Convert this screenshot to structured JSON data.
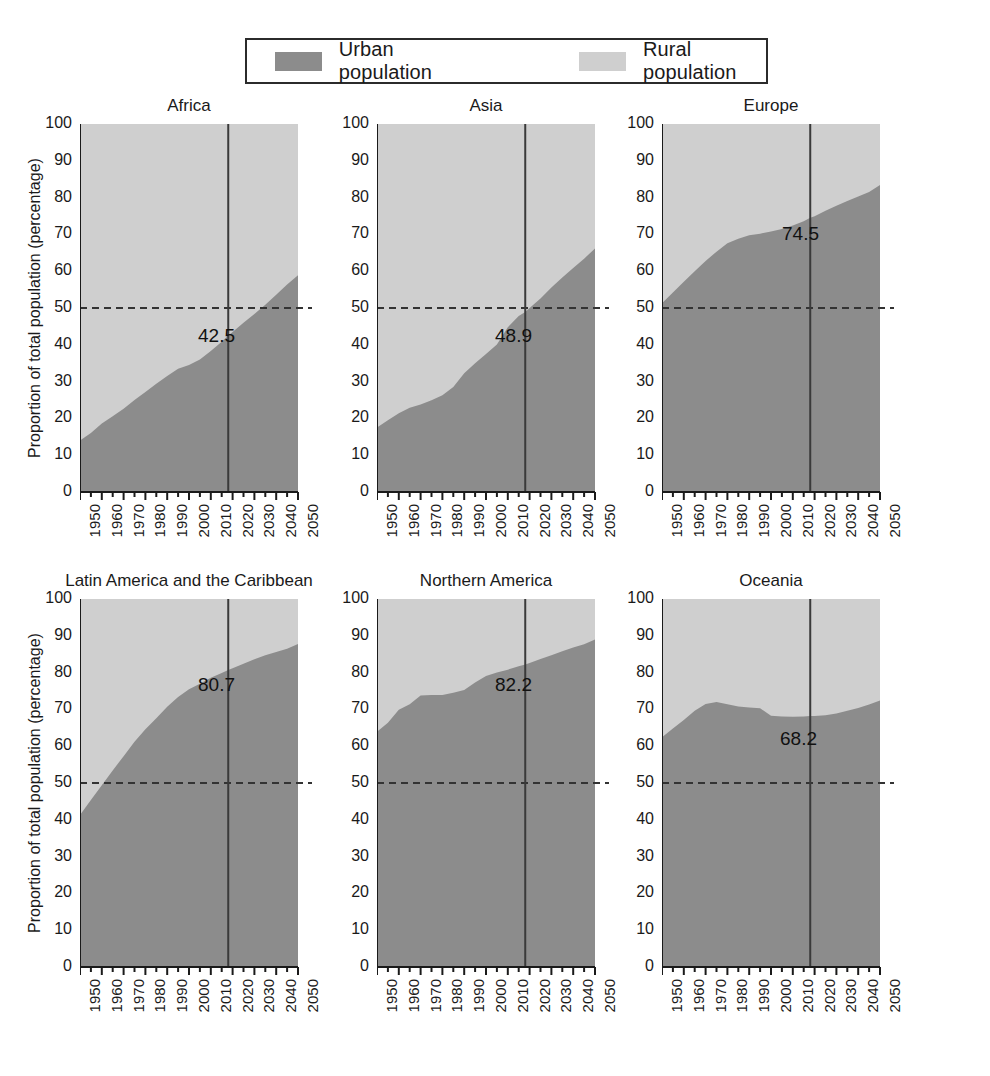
{
  "legend": {
    "urban_label": "Urban population",
    "rural_label": "Rural population",
    "urban_color": "#8c8c8c",
    "rural_color": "#cfcfcf"
  },
  "axis": {
    "ylabel": "Proportion of total population (percentage)",
    "yticks": [
      "100",
      "90",
      "80",
      "70",
      "60",
      "50",
      "40",
      "30",
      "20",
      "10",
      "0"
    ],
    "xticks": [
      "1950",
      "1960",
      "1970",
      "1980",
      "1990",
      "2000",
      "2010",
      "2020",
      "2030",
      "2040",
      "2050"
    ],
    "ylim": [
      0,
      100
    ],
    "xlim": [
      1950,
      2050
    ],
    "reference_line": 50,
    "marker_year": 2018
  },
  "chart_data": {
    "type": "area",
    "title": "",
    "xlabel": "",
    "ylabel": "Proportion of total population (percentage)",
    "ylim": [
      0,
      100
    ],
    "xlim": [
      1950,
      2050
    ],
    "grid": false,
    "legend_position": "top",
    "legend": [
      "Urban population",
      "Rural population"
    ],
    "reference_line_y": 50,
    "marker_year": 2018,
    "x": [
      1950,
      1955,
      1960,
      1965,
      1970,
      1975,
      1980,
      1985,
      1990,
      1995,
      2000,
      2005,
      2010,
      2015,
      2018,
      2020,
      2025,
      2030,
      2035,
      2040,
      2045,
      2050
    ],
    "panels": [
      {
        "name": "Africa",
        "value_label": "42.5",
        "urban": [
          14.0,
          16.0,
          18.6,
          20.6,
          22.6,
          25.0,
          27.2,
          29.4,
          31.5,
          33.5,
          34.5,
          36.0,
          38.3,
          40.8,
          42.5,
          43.5,
          46.0,
          48.4,
          50.9,
          53.6,
          56.4,
          58.9
        ],
        "rural": [
          86.0,
          84.0,
          81.4,
          79.4,
          77.4,
          75.0,
          72.8,
          70.6,
          68.5,
          66.5,
          65.5,
          64.0,
          61.7,
          59.2,
          57.5,
          56.5,
          54.0,
          51.6,
          49.1,
          46.4,
          43.6,
          41.1
        ]
      },
      {
        "name": "Asia",
        "value_label": "48.9",
        "urban": [
          17.5,
          19.5,
          21.4,
          22.9,
          23.8,
          24.9,
          26.3,
          28.5,
          32.3,
          35.0,
          37.5,
          40.1,
          44.8,
          47.8,
          48.9,
          50.0,
          52.6,
          55.6,
          58.3,
          60.9,
          63.4,
          66.2
        ],
        "rural": [
          82.5,
          80.5,
          78.6,
          77.1,
          76.2,
          75.1,
          73.7,
          71.5,
          67.7,
          65.0,
          62.5,
          59.9,
          55.2,
          52.2,
          51.1,
          50.0,
          47.4,
          44.4,
          41.7,
          39.1,
          36.6,
          33.8
        ]
      },
      {
        "name": "Europe",
        "value_label": "74.5",
        "urban": [
          51.3,
          54.2,
          57.1,
          60.0,
          62.8,
          65.3,
          67.6,
          68.8,
          69.8,
          70.2,
          70.8,
          71.5,
          72.4,
          73.6,
          74.5,
          74.9,
          76.4,
          77.8,
          79.1,
          80.3,
          81.5,
          83.4
        ],
        "rural": [
          48.7,
          45.8,
          42.9,
          40.0,
          37.2,
          34.7,
          32.4,
          31.2,
          30.2,
          29.8,
          29.2,
          28.5,
          27.6,
          26.4,
          25.5,
          25.1,
          23.6,
          22.2,
          20.9,
          19.7,
          18.5,
          16.6
        ]
      },
      {
        "name": "Latin America and the Caribbean",
        "value_label": "80.7",
        "urban": [
          41.3,
          45.4,
          49.4,
          53.4,
          57.3,
          61.2,
          64.6,
          67.6,
          70.7,
          73.4,
          75.5,
          77.0,
          78.6,
          79.9,
          80.7,
          81.2,
          82.4,
          83.6,
          84.7,
          85.6,
          86.5,
          87.8
        ],
        "rural": [
          58.7,
          54.6,
          50.6,
          46.6,
          42.7,
          38.8,
          35.4,
          32.4,
          29.3,
          26.6,
          24.5,
          23.0,
          21.4,
          20.1,
          19.3,
          18.8,
          17.6,
          16.4,
          15.3,
          14.4,
          13.5,
          12.2
        ]
      },
      {
        "name": "Northern America",
        "value_label": "82.2",
        "urban": [
          63.9,
          66.4,
          69.9,
          71.4,
          73.8,
          73.9,
          73.9,
          74.5,
          75.3,
          77.3,
          79.1,
          80.0,
          80.8,
          81.7,
          82.2,
          82.6,
          83.7,
          84.7,
          85.8,
          86.8,
          87.7,
          89.0
        ],
        "rural": [
          36.1,
          33.6,
          30.1,
          28.6,
          26.2,
          26.1,
          26.1,
          25.5,
          24.7,
          22.7,
          20.9,
          20.0,
          19.2,
          18.3,
          17.8,
          17.4,
          16.3,
          15.3,
          14.2,
          13.2,
          12.3,
          11.0
        ]
      },
      {
        "name": "Oceania",
        "value_label": "68.2",
        "urban": [
          62.4,
          64.8,
          67.1,
          69.6,
          71.5,
          72.0,
          71.4,
          70.8,
          70.5,
          70.3,
          68.3,
          68.1,
          68.0,
          68.1,
          68.2,
          68.2,
          68.4,
          68.9,
          69.6,
          70.4,
          71.3,
          72.4
        ],
        "rural": [
          37.6,
          35.2,
          32.9,
          30.4,
          28.5,
          28.0,
          28.6,
          29.2,
          29.5,
          29.7,
          31.7,
          31.9,
          32.0,
          31.9,
          31.8,
          31.8,
          31.6,
          31.1,
          30.4,
          29.6,
          28.7,
          27.6
        ]
      }
    ]
  }
}
